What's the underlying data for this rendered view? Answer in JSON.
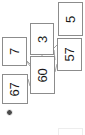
{
  "diagram": {
    "orientation": "rotated-90-ccw",
    "canvas": {
      "width": 85,
      "height": 135,
      "background": "#ffffff"
    },
    "style": {
      "node_border_color": "#8c8c8c",
      "node_fill_color": "#ffffff",
      "edge_color": "#9a9a9a",
      "label_color": "#1a1a1a",
      "ghost_border_color": "#ededed",
      "badge_color": "#4a4a4a"
    },
    "nodes": [
      {
        "id": "n5",
        "label": "5",
        "x": 58,
        "y": 2,
        "w": 25,
        "h": 34
      },
      {
        "id": "n3",
        "label": "3",
        "x": 30,
        "y": 23,
        "w": 24,
        "h": 32
      },
      {
        "id": "n57",
        "label": "57",
        "x": 57,
        "y": 38,
        "w": 25,
        "h": 33
      },
      {
        "id": "n7",
        "label": "7",
        "x": 2,
        "y": 37,
        "w": 25,
        "h": 29
      },
      {
        "id": "n60",
        "label": "60",
        "x": 30,
        "y": 56,
        "w": 25,
        "h": 38
      },
      {
        "id": "n67",
        "label": "67",
        "x": 2,
        "y": 74,
        "w": 26,
        "h": 30
      }
    ],
    "edges": [
      {
        "from": "n3",
        "to": "n60"
      },
      {
        "from": "n3",
        "to": "n57"
      },
      {
        "from": "n57",
        "to": "n60"
      },
      {
        "from": "n7",
        "to": "n60"
      },
      {
        "from": "n67",
        "to": "n60"
      }
    ],
    "ghost_nodes": [
      {
        "id": "ghost-bottom",
        "x": 58,
        "y": 128,
        "w": 25,
        "h": 12
      }
    ],
    "badges": [
      {
        "id": "status-dot",
        "name": "status-dot-icon",
        "x": 6,
        "y": 109
      }
    ]
  }
}
